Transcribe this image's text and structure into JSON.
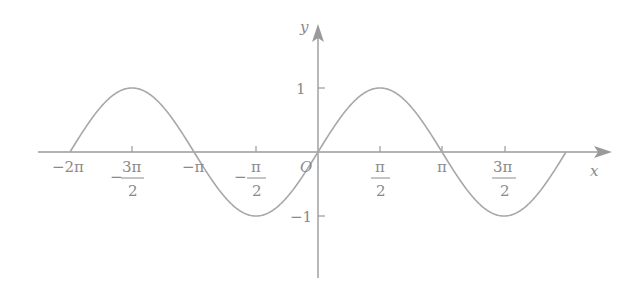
{
  "chart_data": {
    "type": "line",
    "title": "",
    "function": "y = sin x",
    "xlabel": "x",
    "ylabel": "y",
    "origin_label": "O",
    "xlim": [
      -6.2832,
      6.2832
    ],
    "ylim": [
      -1,
      1
    ],
    "grid": false,
    "legend": null,
    "x_ticks": [
      {
        "value": -6.2832,
        "label": "−2π"
      },
      {
        "value": -4.7124,
        "num": "3π",
        "den": "2",
        "sign": "−"
      },
      {
        "value": -3.1416,
        "label": "−π"
      },
      {
        "value": -1.5708,
        "num": "π",
        "den": "2",
        "sign": "−"
      },
      {
        "value": 1.5708,
        "num": "π",
        "den": "2",
        "sign": ""
      },
      {
        "value": 3.1416,
        "label": "π"
      },
      {
        "value": 4.7124,
        "num": "3π",
        "den": "2",
        "sign": ""
      }
    ],
    "y_ticks": [
      {
        "value": 1,
        "label": "1"
      },
      {
        "value": -1,
        "label": "−1"
      }
    ],
    "series": [
      {
        "name": "sin x",
        "x": [
          -6.2832,
          -4.7124,
          -3.1416,
          -1.5708,
          0,
          1.5708,
          3.1416,
          4.7124,
          6.2832
        ],
        "y": [
          0,
          1,
          0,
          -1,
          0,
          1,
          0,
          -1,
          0
        ]
      }
    ]
  },
  "labels": {
    "x_axis": "x",
    "y_axis": "y",
    "origin": "O",
    "y_one": "1",
    "y_neg_one": "−1",
    "neg_two_pi": "−2π",
    "neg_pi": "−π",
    "pi": "π",
    "minus": "−",
    "three_pi": "3π",
    "pi_num": "π",
    "two": "2"
  }
}
